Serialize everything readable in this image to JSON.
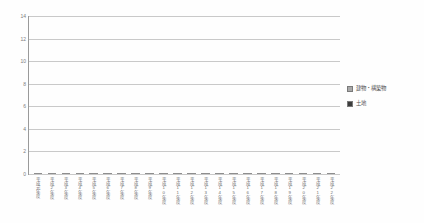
{
  "chart_data": {
    "type": "bar",
    "stacked": true,
    "title": "",
    "subtitle": "",
    "xlabel": "",
    "ylabel": "",
    "ylim": [
      0,
      14
    ],
    "ytick_values": [
      0,
      2,
      4,
      6,
      8,
      10,
      12,
      14
    ],
    "ytick_labels": [
      "0",
      "2",
      "4",
      "6",
      "8",
      "10",
      "12",
      "14"
    ],
    "grid": true,
    "legend_position": "right",
    "categories": [
      "平成元年度",
      "平成2年度",
      "平成3年度",
      "平成4年度",
      "平成5年度",
      "平成6年度",
      "平成7年度",
      "平成8年度",
      "平成9年度",
      "平成10年度",
      "平成11年度",
      "平成12年度",
      "平成13年度",
      "平成14年度",
      "平成15年度",
      "平成16年度",
      "平成17年度",
      "平成18年度",
      "平成19年度",
      "平成20年度",
      "平成21年度",
      "平成22年度"
    ],
    "series": [
      {
        "name": "土地",
        "color": "#3c3c3c",
        "values": [
          2.6,
          2.7,
          2.9,
          3.0,
          3.1,
          3.2,
          3.3,
          3.4,
          3.6,
          3.8,
          4.0,
          4.1,
          4.3,
          4.4,
          4.5,
          4.6,
          4.6,
          4.7,
          4.7,
          4.8,
          4.9,
          5.0
        ]
      },
      {
        "name": "建物・構築物",
        "color": "#a9a9a9",
        "values": [
          5.8,
          6.1,
          6.3,
          6.5,
          6.9,
          7.0,
          7.2,
          7.3,
          7.5,
          7.6,
          7.7,
          7.8,
          7.9,
          8.0,
          8.0,
          8.1,
          8.2,
          8.3,
          8.3,
          8.4,
          8.4,
          8.4
        ]
      }
    ],
    "totals": [
      8.4,
      8.8,
      9.2,
      9.5,
      10.0,
      10.2,
      10.5,
      10.7,
      11.1,
      11.4,
      11.7,
      11.9,
      12.2,
      12.4,
      12.5,
      12.7,
      12.8,
      13.0,
      13.0,
      13.2,
      13.3,
      13.4
    ]
  },
  "legend": {
    "items": [
      {
        "label": "建物・構築物",
        "color": "#a9a9a9"
      },
      {
        "label": "土地",
        "color": "#3c3c3c"
      }
    ]
  },
  "colors": {
    "series_upper": "#a9a9a9",
    "series_lower": "#3c3c3c",
    "gridline": "#c9c9c9",
    "axis": "#9a9a9a",
    "tick_text": "#7d7d7d",
    "background": "#fefefe"
  }
}
